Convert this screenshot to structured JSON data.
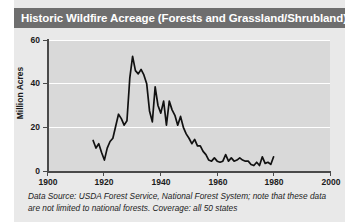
{
  "title": "Historic Wildfire Acreage (Forests and Grassland/Shrubland)",
  "caption": "Data Source: USDA Forest Service, National Forest System; note that these data are not limited to national forests. Coverage: all 50 states",
  "colors": {
    "title_bar": "#6e6e6e",
    "title_text": "#ffffff",
    "panel": "#e9e9e9",
    "plot_bg": "#d9d9d9",
    "gridline": "#ffffff",
    "axis": "#4a4a4a",
    "line": "#111111"
  },
  "chart_data": {
    "type": "line",
    "title": "Historic Wildfire Acreage (Forests and Grassland/Shrubland)",
    "xlabel": "",
    "ylabel": "Million Acres",
    "xlim": [
      1900,
      2000
    ],
    "ylim": [
      0,
      60
    ],
    "xticks": [
      1900,
      1920,
      1940,
      1960,
      1980,
      2000
    ],
    "yticks": [
      0,
      20,
      40,
      60
    ],
    "grid": "horizontal",
    "legend": "none",
    "series": [
      {
        "name": "Wildfire acreage burned",
        "x": [
          1916,
          1917,
          1918,
          1919,
          1920,
          1921,
          1922,
          1923,
          1924,
          1925,
          1926,
          1927,
          1928,
          1929,
          1930,
          1931,
          1932,
          1933,
          1934,
          1935,
          1936,
          1937,
          1938,
          1939,
          1940,
          1941,
          1942,
          1943,
          1944,
          1945,
          1946,
          1947,
          1948,
          1949,
          1950,
          1951,
          1952,
          1953,
          1954,
          1955,
          1956,
          1957,
          1958,
          1959,
          1960,
          1961,
          1962,
          1963,
          1964,
          1965,
          1966,
          1967,
          1968,
          1969,
          1970,
          1971,
          1972,
          1973,
          1974,
          1975,
          1976,
          1977,
          1978,
          1979,
          1980
        ],
        "values": [
          14.0,
          10.5,
          12.5,
          8.5,
          5.0,
          10.5,
          13.5,
          15.0,
          20.5,
          26.0,
          24.0,
          21.0,
          23.0,
          42.5,
          52.5,
          46.0,
          44.5,
          46.5,
          44.0,
          40.0,
          27.5,
          22.5,
          38.5,
          30.0,
          26.5,
          32.0,
          21.0,
          32.0,
          28.0,
          25.5,
          21.0,
          25.0,
          20.0,
          17.0,
          15.0,
          12.5,
          14.5,
          11.5,
          11.5,
          9.0,
          7.5,
          5.0,
          4.5,
          6.0,
          4.5,
          4.0,
          4.5,
          7.5,
          4.5,
          6.0,
          4.5,
          5.0,
          6.0,
          5.0,
          4.5,
          4.5,
          3.0,
          2.5,
          4.0,
          2.5,
          6.5,
          3.5,
          4.0,
          3.0,
          6.5
        ]
      }
    ]
  },
  "axis": {
    "y_labels": [
      "60",
      "40",
      "20",
      "0"
    ],
    "x_labels": [
      "1900",
      "1920",
      "1940",
      "1960",
      "1980",
      "2000"
    ],
    "y_title": "Million Acres"
  }
}
